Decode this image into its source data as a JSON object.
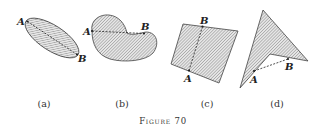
{
  "figure": {
    "caption": "Figure 70",
    "panels": [
      {
        "id": "a",
        "label": "(a)",
        "shape": "ellipse",
        "points": {
          "A": "A",
          "B": "B"
        },
        "segment_inside": true
      },
      {
        "id": "b",
        "label": "(b)",
        "shape": "kidney",
        "points": {
          "A": "A",
          "B": "B"
        },
        "segment_inside": false
      },
      {
        "id": "c",
        "label": "(c)",
        "shape": "quadrilateral",
        "points": {
          "A": "A",
          "B": "B"
        },
        "segment_inside": true
      },
      {
        "id": "d",
        "label": "(d)",
        "shape": "arrowhead",
        "points": {
          "A": "A",
          "B": "B"
        },
        "segment_inside": false
      }
    ]
  },
  "colors": {
    "stroke": "#333333",
    "hatch": "#9a9a9a",
    "background": "#ffffff"
  }
}
